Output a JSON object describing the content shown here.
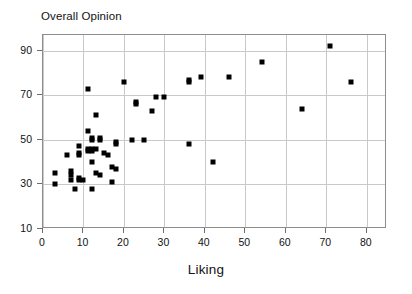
{
  "chart_data": {
    "type": "scatter",
    "title": "Overall Opinion",
    "xlabel": "Liking",
    "ylabel": "",
    "xlim": [
      0,
      85
    ],
    "ylim": [
      10,
      97
    ],
    "xticks": [
      0,
      10,
      20,
      30,
      40,
      50,
      60,
      70,
      80
    ],
    "xtick_labels": [
      "0",
      "10",
      "20",
      "30",
      "40",
      "50",
      "60",
      "70",
      "80"
    ],
    "yticks": [
      10,
      30,
      50,
      70,
      90
    ],
    "ytick_labels": [
      "10",
      "30",
      "50",
      "70",
      "90"
    ],
    "grid": true,
    "grid_x": [
      0,
      10,
      20,
      30,
      40,
      50,
      60,
      70,
      80
    ],
    "grid_y": [
      30,
      50,
      70,
      90
    ],
    "legend": null,
    "marker": "square",
    "marker_color": "#000000",
    "points": [
      {
        "x": 3,
        "y": 35
      },
      {
        "x": 3,
        "y": 30
      },
      {
        "x": 6,
        "y": 43
      },
      {
        "x": 7,
        "y": 36
      },
      {
        "x": 7,
        "y": 34
      },
      {
        "x": 7,
        "y": 32
      },
      {
        "x": 8,
        "y": 28
      },
      {
        "x": 9,
        "y": 47
      },
      {
        "x": 9,
        "y": 44
      },
      {
        "x": 9,
        "y": 43
      },
      {
        "x": 9,
        "y": 33
      },
      {
        "x": 9,
        "y": 32
      },
      {
        "x": 10,
        "y": 32
      },
      {
        "x": 11,
        "y": 54
      },
      {
        "x": 11,
        "y": 46
      },
      {
        "x": 11,
        "y": 45
      },
      {
        "x": 11,
        "y": 73
      },
      {
        "x": 12,
        "y": 51
      },
      {
        "x": 12,
        "y": 50
      },
      {
        "x": 12,
        "y": 46
      },
      {
        "x": 12,
        "y": 45
      },
      {
        "x": 12,
        "y": 40
      },
      {
        "x": 12,
        "y": 28
      },
      {
        "x": 13,
        "y": 46
      },
      {
        "x": 13,
        "y": 35
      },
      {
        "x": 13,
        "y": 61
      },
      {
        "x": 14,
        "y": 51
      },
      {
        "x": 14,
        "y": 50
      },
      {
        "x": 14,
        "y": 34
      },
      {
        "x": 15,
        "y": 44
      },
      {
        "x": 16,
        "y": 43
      },
      {
        "x": 17,
        "y": 38
      },
      {
        "x": 17,
        "y": 31
      },
      {
        "x": 18,
        "y": 49
      },
      {
        "x": 18,
        "y": 48
      },
      {
        "x": 18,
        "y": 37
      },
      {
        "x": 20,
        "y": 76
      },
      {
        "x": 22,
        "y": 50
      },
      {
        "x": 23,
        "y": 67
      },
      {
        "x": 23,
        "y": 66
      },
      {
        "x": 25,
        "y": 50
      },
      {
        "x": 27,
        "y": 63
      },
      {
        "x": 28,
        "y": 69
      },
      {
        "x": 30,
        "y": 69
      },
      {
        "x": 36,
        "y": 77
      },
      {
        "x": 36,
        "y": 76
      },
      {
        "x": 36,
        "y": 48
      },
      {
        "x": 39,
        "y": 78
      },
      {
        "x": 42,
        "y": 40
      },
      {
        "x": 46,
        "y": 78
      },
      {
        "x": 54,
        "y": 85
      },
      {
        "x": 64,
        "y": 64
      },
      {
        "x": 71,
        "y": 92
      },
      {
        "x": 76,
        "y": 76
      }
    ]
  }
}
